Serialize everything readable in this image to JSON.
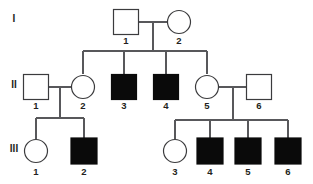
{
  "diagram": {
    "type": "pedigree-chart",
    "title": "",
    "colors": {
      "affected_fill": "#0a0a0a",
      "unaffected_fill": "#ffffff",
      "symbol_stroke": "#3b3b3d",
      "line_stroke": "#58585b",
      "label_color": "#231f20",
      "background": "#ffffff"
    },
    "legend": {
      "square_meaning": "male",
      "circle_meaning": "female",
      "filled_meaning": "affected",
      "open_meaning": "unaffected"
    },
    "generations": [
      {
        "id": "I",
        "label": "I",
        "label_x": 14,
        "label_y": 19,
        "individuals": [
          {
            "id": "I-1",
            "number": "1",
            "sex": "male",
            "shape": "square",
            "affected": true,
            "filled": false,
            "cx": 126,
            "cy": 22,
            "size": 25,
            "label_x": 126,
            "label_y": 41
          },
          {
            "id": "I-2",
            "number": "2",
            "sex": "female",
            "shape": "circle",
            "affected": false,
            "filled": false,
            "cx": 179,
            "cy": 22,
            "size": 23,
            "label_x": 179,
            "label_y": 41
          }
        ]
      },
      {
        "id": "II",
        "label": "II",
        "label_x": 14,
        "label_y": 85,
        "individuals": [
          {
            "id": "II-1",
            "number": "1",
            "sex": "male",
            "shape": "square",
            "affected": false,
            "filled": false,
            "cx": 36,
            "cy": 87,
            "size": 25,
            "label_x": 36,
            "label_y": 106
          },
          {
            "id": "II-2",
            "number": "2",
            "sex": "female",
            "shape": "circle",
            "affected": false,
            "filled": false,
            "cx": 83,
            "cy": 87,
            "size": 23,
            "label_x": 83,
            "label_y": 106
          },
          {
            "id": "II-3",
            "number": "3",
            "sex": "male",
            "shape": "square",
            "affected": true,
            "filled": true,
            "cx": 124,
            "cy": 87,
            "size": 25,
            "label_x": 124,
            "label_y": 106
          },
          {
            "id": "II-4",
            "number": "4",
            "sex": "male",
            "shape": "square",
            "affected": true,
            "filled": true,
            "cx": 166,
            "cy": 87,
            "size": 25,
            "label_x": 166,
            "label_y": 106
          },
          {
            "id": "II-5",
            "number": "5",
            "sex": "female",
            "shape": "circle",
            "affected": false,
            "filled": false,
            "cx": 207,
            "cy": 87,
            "size": 23,
            "label_x": 207,
            "label_y": 106
          },
          {
            "id": "II-6",
            "number": "6",
            "sex": "male",
            "shape": "square",
            "affected": false,
            "filled": false,
            "cx": 259,
            "cy": 87,
            "size": 25,
            "label_x": 259,
            "label_y": 106
          }
        ]
      },
      {
        "id": "III",
        "label": "III",
        "label_x": 14,
        "label_y": 149,
        "individuals": [
          {
            "id": "III-1",
            "number": "1",
            "sex": "female",
            "shape": "circle",
            "affected": false,
            "filled": false,
            "cx": 36,
            "cy": 151,
            "size": 23,
            "label_x": 36,
            "label_y": 172
          },
          {
            "id": "III-2",
            "number": "2",
            "sex": "male",
            "shape": "square",
            "affected": true,
            "filled": true,
            "cx": 84,
            "cy": 151,
            "size": 26,
            "label_x": 84,
            "label_y": 172
          },
          {
            "id": "III-3",
            "number": "3",
            "sex": "female",
            "shape": "circle",
            "affected": false,
            "filled": false,
            "cx": 175,
            "cy": 151,
            "size": 23,
            "label_x": 175,
            "label_y": 172
          },
          {
            "id": "III-4",
            "number": "4",
            "sex": "male",
            "shape": "square",
            "affected": true,
            "filled": true,
            "cx": 210,
            "cy": 151,
            "size": 26,
            "label_x": 210,
            "label_y": 172
          },
          {
            "id": "III-5",
            "number": "5",
            "sex": "male",
            "shape": "square",
            "affected": true,
            "filled": true,
            "cx": 248,
            "cy": 151,
            "size": 26,
            "label_x": 248,
            "label_y": 172
          },
          {
            "id": "III-6",
            "number": "6",
            "sex": "male",
            "shape": "square",
            "affected": true,
            "filled": true,
            "cx": 288,
            "cy": 151,
            "size": 26,
            "label_x": 288,
            "label_y": 172
          }
        ]
      }
    ],
    "matings": [
      {
        "id": "mating-I1-I2",
        "partners": [
          "I-1",
          "I-2"
        ],
        "line_y": 22,
        "x_start": 139,
        "x_end": 167,
        "descender_x": 153,
        "descender_y_end": 51
      },
      {
        "id": "mating-II1-II2",
        "partners": [
          "II-1",
          "II-2"
        ],
        "line_y": 87,
        "x_start": 49,
        "x_end": 72,
        "descender_x": 60,
        "descender_y_end": 118
      },
      {
        "id": "mating-II5-II6",
        "partners": [
          "II-5",
          "II-6"
        ],
        "line_y": 87,
        "x_start": 219,
        "x_end": 247,
        "descender_x": 233,
        "descender_y_end": 120
      }
    ],
    "sibships": [
      {
        "id": "sibship-generation-II",
        "parents": "mating-I1-I2",
        "line_y": 51,
        "x_start": 83,
        "x_end": 207,
        "children": [
          "II-2",
          "II-3",
          "II-4",
          "II-5"
        ],
        "drop_x": [
          83,
          124,
          166,
          207
        ],
        "drop_y_end": 74
      },
      {
        "id": "sibship-generation-III-left",
        "parents": "mating-II1-II2",
        "line_y": 118,
        "x_start": 36,
        "x_end": 84,
        "children": [
          "III-1",
          "III-2"
        ],
        "drop_x": [
          36,
          84
        ],
        "drop_y_end": 139
      },
      {
        "id": "sibship-generation-III-right",
        "parents": "mating-II5-II6",
        "line_y": 120,
        "x_start": 175,
        "x_end": 288,
        "children": [
          "III-3",
          "III-4",
          "III-5",
          "III-6"
        ],
        "drop_x": [
          175,
          210,
          248,
          288
        ],
        "drop_y_end": 139
      }
    ]
  }
}
